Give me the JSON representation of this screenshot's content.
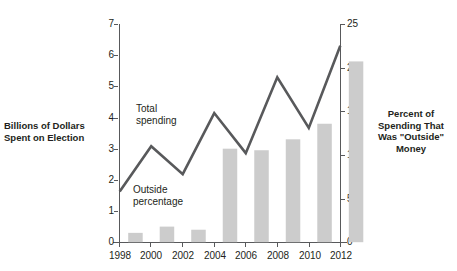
{
  "chart_data": {
    "type": "bar",
    "title": "",
    "subtitle": "",
    "categories": [
      "1998",
      "2000",
      "2002",
      "2004",
      "2006",
      "2008",
      "2010",
      "2012"
    ],
    "x": [
      1998,
      2000,
      2002,
      2004,
      2006,
      2008,
      2010,
      2012
    ],
    "xlabel": "",
    "grid": false,
    "legend_position": "inline-annotations",
    "series": [
      {
        "name": "Total spending",
        "type": "bar",
        "axis": "left",
        "unit": "Billions of Dollars",
        "values": [
          0.3,
          0.5,
          0.4,
          3.0,
          2.95,
          3.3,
          3.8,
          5.8
        ]
      },
      {
        "name": "Outside percentage",
        "type": "line",
        "axis": "right",
        "unit": "Percent",
        "values": [
          5.8,
          11.0,
          7.8,
          14.8,
          10.2,
          18.9,
          13.1,
          22.5
        ]
      }
    ],
    "left_axis": {
      "label": "Billions of Dollars\nSpent on Election",
      "ticks": [
        0,
        1,
        2,
        3,
        4,
        5,
        6,
        7
      ],
      "tick_labels": [
        "0",
        "1",
        "2",
        "3",
        "4",
        "5",
        "6",
        "7"
      ],
      "ylim": [
        0,
        7
      ]
    },
    "right_axis": {
      "label": "Percent of\nSpending That\nWas \"Outside\"\nMoney",
      "ticks": [
        0,
        5,
        10,
        15,
        20,
        25
      ],
      "tick_labels": [
        "0",
        "5",
        "10",
        "15",
        "20",
        "25"
      ],
      "ylim": [
        0,
        25
      ]
    },
    "annotations": [
      {
        "name": "total-spending",
        "text": "Total\nspending"
      },
      {
        "name": "outside-percentage",
        "text": "Outside\npercentage"
      }
    ],
    "colors": {
      "bar": "#cccccc",
      "line": "#58595b",
      "axis": "#58595b",
      "text": "#231f20",
      "background": "#ffffff"
    }
  }
}
